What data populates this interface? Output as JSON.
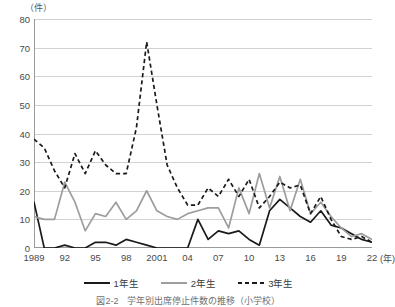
{
  "figure": {
    "unit_label": "（件）",
    "x_axis_unit": "(年)",
    "caption": "図2-2　学年別出席停止件数の推移（小学校）"
  },
  "legend": {
    "position": "bottom-center",
    "items": [
      {
        "label": "1年生",
        "style": "solid-black",
        "color": "#1a1a1a"
      },
      {
        "label": "2年生",
        "style": "solid-gray",
        "color": "#9d9d9d"
      },
      {
        "label": "3年生",
        "style": "dashed-black",
        "color": "#1a1a1a"
      }
    ]
  },
  "chart_data": {
    "type": "line",
    "title": "",
    "xlabel": "(年)",
    "ylabel": "（件）",
    "ylim": [
      0,
      80
    ],
    "ytick_labels": [
      "0",
      "10",
      "20",
      "30",
      "40",
      "50",
      "60",
      "70",
      "80"
    ],
    "ytick_values": [
      0,
      10,
      20,
      30,
      40,
      50,
      60,
      70,
      80
    ],
    "grid": true,
    "xtick_labels": [
      "1989",
      "92",
      "95",
      "98",
      "2001",
      "04",
      "07",
      "10",
      "13",
      "16",
      "19",
      "22"
    ],
    "xtick_values": [
      1989,
      1992,
      1995,
      1998,
      2001,
      2004,
      2007,
      2010,
      2013,
      2016,
      2019,
      2022
    ],
    "x": [
      1989,
      1990,
      1991,
      1992,
      1993,
      1994,
      1995,
      1996,
      1997,
      1998,
      1999,
      2000,
      2001,
      2002,
      2003,
      2004,
      2005,
      2006,
      2007,
      2008,
      2009,
      2010,
      2011,
      2012,
      2013,
      2014,
      2015,
      2016,
      2017,
      2018,
      2019,
      2020,
      2021,
      2022
    ],
    "series": [
      {
        "name": "1年生",
        "color": "#1a1a1a",
        "style": "solid",
        "values": [
          16,
          0,
          0,
          1,
          0,
          0,
          2,
          2,
          1,
          3,
          2,
          1,
          0,
          0,
          0,
          0,
          10,
          3,
          6,
          5,
          6,
          3,
          1,
          13,
          17,
          14,
          11,
          9,
          13,
          8,
          7,
          5,
          3,
          2
        ]
      },
      {
        "name": "2年生",
        "color": "#9d9d9d",
        "style": "solid",
        "values": [
          11,
          10,
          10,
          23,
          16,
          6,
          12,
          11,
          16,
          10,
          13,
          20,
          13,
          11,
          10,
          12,
          13,
          14,
          14,
          7,
          21,
          12,
          26,
          14,
          25,
          13,
          24,
          12,
          16,
          11,
          7,
          4,
          5,
          3
        ]
      },
      {
        "name": "3年生",
        "color": "#1a1a1a",
        "style": "dashed",
        "values": [
          38,
          35,
          27,
          21,
          33,
          26,
          34,
          29,
          26,
          26,
          42,
          72,
          50,
          29,
          21,
          15,
          15,
          21,
          18,
          24,
          18,
          24,
          14,
          18,
          23,
          21,
          22,
          12,
          18,
          10,
          4,
          3,
          4,
          2
        ]
      }
    ]
  }
}
